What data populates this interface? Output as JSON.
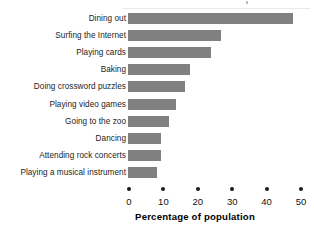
{
  "chart_data": {
    "type": "bar",
    "orientation": "horizontal",
    "title": "",
    "xlabel": "Percentage of population",
    "ylabel": "",
    "xlim": [
      0,
      50
    ],
    "xticks": [
      0,
      10,
      20,
      30,
      40,
      50
    ],
    "xtick_labels": [
      "0",
      "10",
      "20",
      "30",
      "40",
      "50"
    ],
    "grid": false,
    "legend": null,
    "bar_color": "#808080",
    "text_color": "#1a1a1a",
    "categories": [
      "Dining out",
      "Surfing the Internet",
      "Playing cards",
      "Baking",
      "Doing crossword puzzles",
      "Playing video games",
      "Going to the zoo",
      "Dancing",
      "Attending rock concerts",
      "Playing a musical instrument"
    ],
    "values": [
      48,
      27,
      24,
      18,
      16.5,
      14,
      12,
      9.5,
      9.5,
      8.5
    ]
  }
}
